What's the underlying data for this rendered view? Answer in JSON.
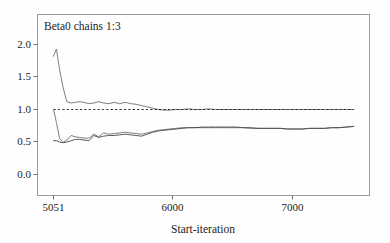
{
  "chart_data": {
    "type": "line",
    "title": "Beta0 chains 1:3",
    "xlabel": "Start-iteration",
    "ylabel": "",
    "xlim": [
      5051,
      7500
    ],
    "ylim": [
      0.0,
      2.25
    ],
    "xticks": [
      5051,
      6000,
      7000
    ],
    "xtick_labels": [
      "5051",
      "6000",
      "7000"
    ],
    "yticks": [
      0.0,
      0.5,
      1.0,
      1.5,
      2.0
    ],
    "ytick_labels": [
      "0.0",
      "0.5",
      "1.0",
      "1.5",
      "2.0"
    ],
    "grid": false,
    "legend": "none",
    "x": [
      5051,
      5075,
      5100,
      5130,
      5160,
      5195,
      5230,
      5265,
      5300,
      5340,
      5380,
      5420,
      5460,
      5500,
      5545,
      5590,
      5635,
      5680,
      5725,
      5770,
      5815,
      5860,
      5905,
      5950,
      6000,
      6050,
      6100,
      6150,
      6205,
      6260,
      6315,
      6370,
      6425,
      6480,
      6540,
      6600,
      6660,
      6720,
      6780,
      6840,
      6900,
      6960,
      7020,
      7080,
      7140,
      7200,
      7260,
      7320,
      7380,
      7440,
      7500
    ],
    "series": [
      {
        "name": "R-hat (upper, 80% interval ratio)",
        "color": "#6f6f6f",
        "style": "solid",
        "values": [
          1.82,
          1.93,
          1.62,
          1.33,
          1.12,
          1.1,
          1.11,
          1.12,
          1.11,
          1.09,
          1.1,
          1.12,
          1.1,
          1.09,
          1.11,
          1.09,
          1.11,
          1.09,
          1.08,
          1.06,
          1.04,
          1.02,
          1.0,
          0.99,
          0.99,
          1.0,
          1.0,
          1.01,
          1.0,
          1.0,
          1.01,
          1.0,
          1.0,
          1.0,
          1.0,
          1.0,
          1.0,
          1.0,
          1.0,
          1.0,
          1.0,
          1.0,
          1.0,
          1.0,
          1.0,
          1.0,
          1.0,
          1.0,
          1.0,
          1.0,
          1.0
        ]
      },
      {
        "name": "reference line at 1.0",
        "color": "#2a2a2a",
        "style": "dashed",
        "values": [
          1.0,
          1.0,
          1.0,
          1.0,
          1.0,
          1.0,
          1.0,
          1.0,
          1.0,
          1.0,
          1.0,
          1.0,
          1.0,
          1.0,
          1.0,
          1.0,
          1.0,
          1.0,
          1.0,
          1.0,
          1.0,
          1.0,
          1.0,
          1.0,
          1.0,
          1.0,
          1.0,
          1.0,
          1.0,
          1.0,
          1.0,
          1.0,
          1.0,
          1.0,
          1.0,
          1.0,
          1.0,
          1.0,
          1.0,
          1.0,
          1.0,
          1.0,
          1.0,
          1.0,
          1.0,
          1.0,
          1.0,
          1.0,
          1.0,
          1.0,
          1.0
        ]
      },
      {
        "name": "pooled 80% interval width",
        "color": "#707070",
        "style": "solid",
        "values": [
          1.0,
          0.8,
          0.56,
          0.49,
          0.53,
          0.6,
          0.58,
          0.57,
          0.56,
          0.56,
          0.62,
          0.58,
          0.64,
          0.62,
          0.63,
          0.64,
          0.65,
          0.64,
          0.63,
          0.62,
          0.64,
          0.66,
          0.68,
          0.69,
          0.7,
          0.71,
          0.72,
          0.72,
          0.72,
          0.72,
          0.72,
          0.72,
          0.72,
          0.72,
          0.72,
          0.72,
          0.71,
          0.71,
          0.71,
          0.71,
          0.71,
          0.7,
          0.7,
          0.7,
          0.71,
          0.71,
          0.71,
          0.72,
          0.72,
          0.73,
          0.74
        ]
      },
      {
        "name": "within-chain 80% interval width",
        "color": "#4a4a4a",
        "style": "solid",
        "values": [
          0.52,
          0.52,
          0.5,
          0.49,
          0.5,
          0.52,
          0.54,
          0.54,
          0.53,
          0.52,
          0.6,
          0.57,
          0.59,
          0.6,
          0.6,
          0.61,
          0.62,
          0.61,
          0.6,
          0.59,
          0.62,
          0.65,
          0.67,
          0.68,
          0.69,
          0.7,
          0.71,
          0.72,
          0.72,
          0.73,
          0.73,
          0.73,
          0.73,
          0.73,
          0.73,
          0.72,
          0.72,
          0.71,
          0.71,
          0.71,
          0.71,
          0.7,
          0.7,
          0.7,
          0.71,
          0.71,
          0.71,
          0.72,
          0.72,
          0.73,
          0.74
        ]
      }
    ]
  },
  "axes": {
    "frame_color": "#9a9a9a",
    "tick_color": "#6e6e6e",
    "text_color": "#1c1c1c"
  }
}
